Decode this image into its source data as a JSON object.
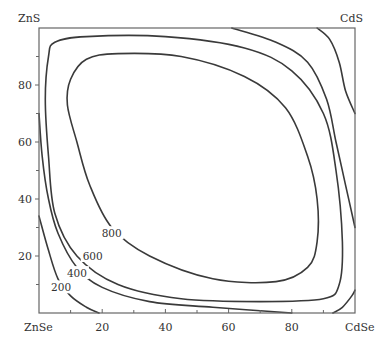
{
  "chart_data": {
    "type": "contour",
    "title": "",
    "xlabel": "",
    "ylabel": "",
    "xlim": [
      0,
      100
    ],
    "ylim": [
      0,
      100
    ],
    "grid": false,
    "corner_labels": {
      "top_left": "ZnS",
      "top_right": "CdS",
      "bottom_left": "ZnSe",
      "bottom_right": "CdSe"
    },
    "x_ticks": [
      20,
      40,
      60,
      80
    ],
    "y_ticks": [
      20,
      40,
      60,
      80
    ],
    "x_tick_labels": [
      "20",
      "40",
      "60",
      "80"
    ],
    "y_tick_labels": [
      "20",
      "40",
      "60",
      "80"
    ],
    "contour_levels": [
      200,
      400,
      600,
      800
    ],
    "contour_labels": [
      {
        "text": "800",
        "x": 23,
        "y": 28
      },
      {
        "text": "600",
        "x": 17,
        "y": 20
      },
      {
        "text": "400",
        "x": 12,
        "y": 14
      },
      {
        "text": "200",
        "x": 7,
        "y": 9
      }
    ],
    "contours": [
      {
        "level": 200,
        "segments": [
          [
            [
              0,
              34
            ],
            [
              3,
              22
            ],
            [
              6,
              12
            ],
            [
              10,
              6
            ],
            [
              15,
              2
            ],
            [
              19,
              0
            ]
          ],
          [
            [
              88,
              100
            ],
            [
              92,
              96
            ],
            [
              95,
              88
            ],
            [
              97,
              78
            ],
            [
              100,
              70
            ]
          ]
        ]
      },
      {
        "level": 400,
        "segments": [
          [
            [
              0,
              70
            ],
            [
              1,
              55
            ],
            [
              3,
              40
            ],
            [
              6,
              28
            ],
            [
              12,
              16
            ],
            [
              20,
              9
            ],
            [
              35,
              4
            ],
            [
              55,
              2
            ],
            [
              80,
              0
            ]
          ],
          [
            [
              61,
              100
            ],
            [
              75,
              95
            ],
            [
              85,
              88
            ],
            [
              91,
              75
            ],
            [
              94,
              60
            ],
            [
              97,
              45
            ],
            [
              100,
              30
            ]
          ],
          [
            [
              93,
              0
            ],
            [
              96,
              2
            ],
            [
              99,
              6
            ],
            [
              100,
              8
            ]
          ]
        ]
      },
      {
        "level": 600,
        "closed": true,
        "points": [
          [
            3,
            90
          ],
          [
            5,
            95
          ],
          [
            15,
            97
          ],
          [
            40,
            97
          ],
          [
            65,
            93
          ],
          [
            80,
            85
          ],
          [
            90,
            70
          ],
          [
            94,
            50
          ],
          [
            96,
            25
          ],
          [
            95,
            10
          ],
          [
            90,
            5
          ],
          [
            70,
            4
          ],
          [
            45,
            5
          ],
          [
            25,
            10
          ],
          [
            12,
            20
          ],
          [
            5,
            35
          ],
          [
            3,
            55
          ],
          [
            2,
            75
          ]
        ]
      },
      {
        "level": 800,
        "closed": true,
        "points": [
          [
            10,
            82
          ],
          [
            15,
            89
          ],
          [
            25,
            91
          ],
          [
            45,
            90
          ],
          [
            65,
            83
          ],
          [
            78,
            72
          ],
          [
            85,
            55
          ],
          [
            88,
            40
          ],
          [
            88,
            25
          ],
          [
            85,
            16
          ],
          [
            75,
            11
          ],
          [
            55,
            12
          ],
          [
            35,
            20
          ],
          [
            23,
            30
          ],
          [
            16,
            45
          ],
          [
            12,
            60
          ],
          [
            9,
            73
          ]
        ]
      }
    ]
  }
}
